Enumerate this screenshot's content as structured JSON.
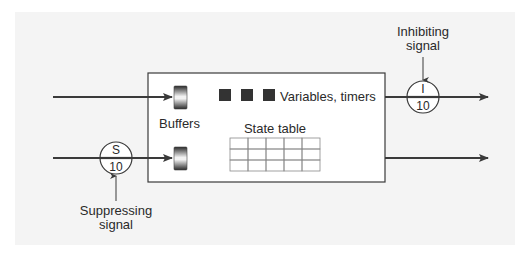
{
  "diagram": {
    "type": "augmented finite state machine (subsumption architecture)",
    "box": {
      "buffers_label": "Buffers",
      "variables_label": "Variables, timers",
      "variables_count": 3,
      "state_table_label": "State table",
      "state_table_columns": 5,
      "state_table_rows": 3
    },
    "suppressor": {
      "letter": "S",
      "value": "10",
      "caption_line1": "Suppressing",
      "caption_line2": "signal"
    },
    "inhibitor": {
      "letter": "I",
      "value": "10",
      "caption_line1": "Inhibiting",
      "caption_line2": "signal"
    },
    "colors": {
      "background_panel": "#f4f4f4",
      "line": "#3a3a3a",
      "box_fill": "#ffffff",
      "variable_square": "#333333",
      "table_line": "#8a8a8a"
    }
  }
}
